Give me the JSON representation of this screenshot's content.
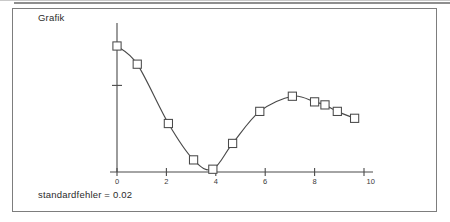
{
  "figure": {
    "title": "Grafik",
    "caption": "standardfehler = 0.02"
  },
  "chart_data": {
    "type": "line",
    "title": "Grafik",
    "xlabel": "",
    "ylabel": "",
    "xlim": [
      -0.35,
      10.3
    ],
    "ylim": [
      0,
      1.62
    ],
    "xticks": [
      0,
      2,
      4,
      6,
      8,
      10
    ],
    "xtick_labels": [
      "0",
      "2",
      "4",
      "6",
      "8",
      "10"
    ],
    "yticks": [
      1.0
    ],
    "ytick_labels": [
      ""
    ],
    "grid": false,
    "legend": null,
    "annotations": [
      "standardfehler = 0.02"
    ],
    "marker": "open-square",
    "series": [
      {
        "name": "curve",
        "x": [
          0.0,
          0.82,
          2.08,
          3.1,
          3.88,
          4.68,
          5.78,
          7.1,
          8.0,
          8.42,
          8.92,
          9.62
        ],
        "values": [
          1.455,
          1.245,
          0.56,
          0.14,
          0.032,
          0.33,
          0.7,
          0.875,
          0.81,
          0.775,
          0.7,
          0.62
        ]
      }
    ]
  }
}
